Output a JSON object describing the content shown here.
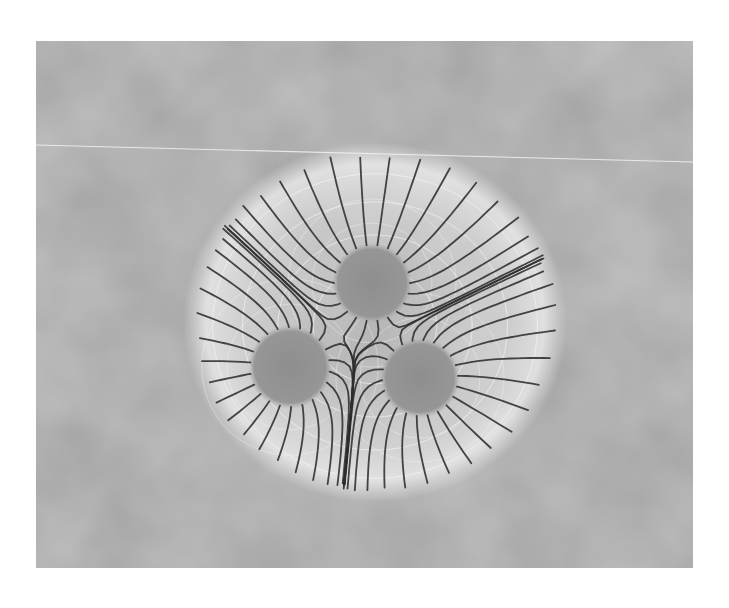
{
  "image": {
    "kind": "grayscale photograph",
    "subject": "field-line pattern radiating from three charge regions",
    "frame": {
      "x": 36,
      "y": 41,
      "width": 657,
      "height": 527
    },
    "page_background": "#ffffff",
    "background_tone": "#9a9a9a",
    "halo_tone": "#e6e6e6",
    "fiber_color": "#2e2e2e",
    "equipotential_color": "#f2f2f2",
    "horizontal_line": {
      "x1": 36,
      "y1": 145,
      "x2": 693,
      "y2": 162,
      "color": "#f0f0f0"
    },
    "halo": {
      "cx": 375,
      "cy": 322,
      "rx": 190,
      "ry": 178
    },
    "charges": [
      {
        "name": "upper",
        "cx": 372,
        "cy": 283,
        "r": 40
      },
      {
        "name": "lower-left",
        "cx": 290,
        "cy": 367,
        "r": 42
      },
      {
        "name": "lower-right",
        "cx": 420,
        "cy": 378,
        "r": 40
      }
    ]
  }
}
